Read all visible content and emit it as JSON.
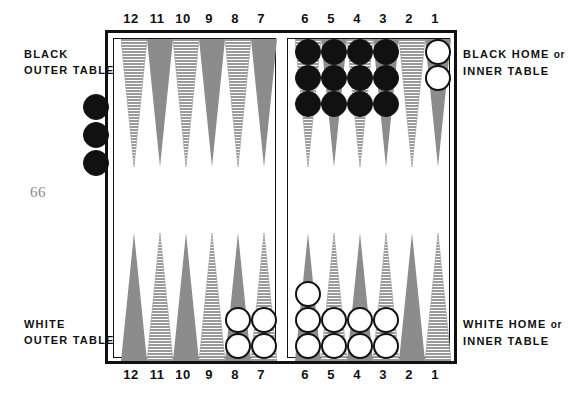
{
  "page_number": "66",
  "top_numbers": [
    "12",
    "11",
    "10",
    "9",
    "8",
    "7",
    "6",
    "5",
    "4",
    "3",
    "2",
    "1"
  ],
  "bottom_numbers": [
    "12",
    "11",
    "10",
    "9",
    "8",
    "7",
    "6",
    "5",
    "4",
    "3",
    "2",
    "1"
  ],
  "captions": {
    "black_outer_line1": "BLACK",
    "black_outer_line2": "OUTER TABLE",
    "white_outer_line1": "WHITE",
    "white_outer_line2": "OUTER TABLE",
    "black_home_line1": "BLACK HOME",
    "black_home_or": "or",
    "black_home_line2": "INNER TABLE",
    "white_home_line1": "WHITE HOME",
    "white_home_or": "or",
    "white_home_line2": "INNER TABLE"
  },
  "colors": {
    "checker_black": "#111111",
    "checker_white": "#ffffff",
    "point_solid": "#8c8c8c",
    "point_hatched": "#9a9a9a",
    "frame": "#111111",
    "page_number": "#8a8a8a"
  },
  "chart_data": {
    "type": "diagram",
    "quadrants": [
      {
        "name": "black-outer-table",
        "position": "top-left",
        "points": [
          "12",
          "11",
          "10",
          "9",
          "8",
          "7"
        ]
      },
      {
        "name": "black-home-table",
        "position": "top-right",
        "points": [
          "6",
          "5",
          "4",
          "3",
          "2",
          "1"
        ]
      },
      {
        "name": "white-outer-table",
        "position": "bottom-left",
        "points": [
          "12",
          "11",
          "10",
          "9",
          "8",
          "7"
        ]
      },
      {
        "name": "white-home-table",
        "position": "bottom-right",
        "points": [
          "6",
          "5",
          "4",
          "3",
          "2",
          "1"
        ]
      }
    ],
    "top_points": [
      {
        "label": "12",
        "fill": "hatched",
        "checkers": 0,
        "color": null
      },
      {
        "label": "11",
        "fill": "solid",
        "checkers": 0,
        "color": null
      },
      {
        "label": "10",
        "fill": "hatched",
        "checkers": 0,
        "color": null
      },
      {
        "label": "9",
        "fill": "solid",
        "checkers": 0,
        "color": null
      },
      {
        "label": "8",
        "fill": "hatched",
        "checkers": 0,
        "color": null
      },
      {
        "label": "7",
        "fill": "solid",
        "checkers": 0,
        "color": null
      },
      {
        "label": "6",
        "fill": "hatched",
        "checkers": 3,
        "color": "black"
      },
      {
        "label": "5",
        "fill": "solid",
        "checkers": 3,
        "color": "black"
      },
      {
        "label": "4",
        "fill": "hatched",
        "checkers": 3,
        "color": "black"
      },
      {
        "label": "3",
        "fill": "solid",
        "checkers": 3,
        "color": "black"
      },
      {
        "label": "2",
        "fill": "hatched",
        "checkers": 0,
        "color": null
      },
      {
        "label": "1",
        "fill": "solid",
        "checkers": 2,
        "color": "white"
      }
    ],
    "bottom_points": [
      {
        "label": "12",
        "fill": "solid",
        "checkers": 0,
        "color": null
      },
      {
        "label": "11",
        "fill": "hatched",
        "checkers": 0,
        "color": null
      },
      {
        "label": "10",
        "fill": "solid",
        "checkers": 0,
        "color": null
      },
      {
        "label": "9",
        "fill": "hatched",
        "checkers": 0,
        "color": null
      },
      {
        "label": "8",
        "fill": "solid",
        "checkers": 2,
        "color": "white"
      },
      {
        "label": "7",
        "fill": "hatched",
        "checkers": 2,
        "color": "white"
      },
      {
        "label": "6",
        "fill": "solid",
        "checkers": 3,
        "color": "white"
      },
      {
        "label": "5",
        "fill": "hatched",
        "checkers": 2,
        "color": "white"
      },
      {
        "label": "4",
        "fill": "solid",
        "checkers": 2,
        "color": "white"
      },
      {
        "label": "3",
        "fill": "hatched",
        "checkers": 2,
        "color": "white"
      },
      {
        "label": "2",
        "fill": "solid",
        "checkers": 0,
        "color": null
      },
      {
        "label": "1",
        "fill": "hatched",
        "checkers": 0,
        "color": null
      }
    ],
    "off_board_checkers": {
      "side": "left",
      "color": "black",
      "count": 3
    }
  }
}
